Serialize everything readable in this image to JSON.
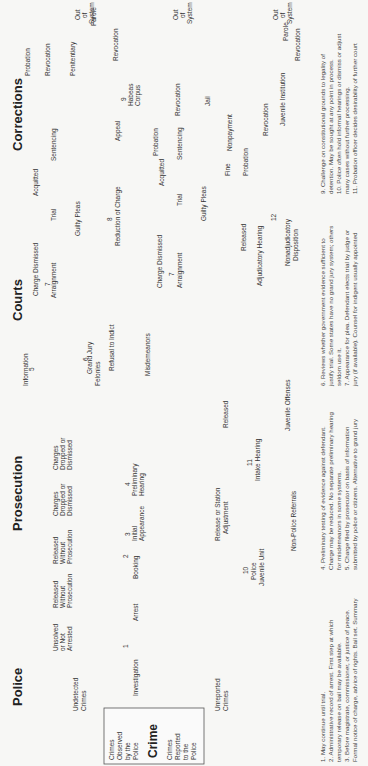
{
  "sections": {
    "police": "Police",
    "prosecution": "Prosecution",
    "courts": "Courts",
    "corrections": "Corrections"
  },
  "crime_box": {
    "observed": [
      "Crimes",
      "Observed",
      "by the",
      "Police"
    ],
    "title": "Crime",
    "reported": [
      "Crimes",
      "Reported",
      "to the",
      "Police"
    ]
  },
  "labels": {
    "undetected": [
      "Undetected",
      "Crimes"
    ],
    "unreported": [
      "Unreported",
      "Crimes"
    ],
    "unsolved": [
      "Unsolved",
      "or Not",
      "Arrested"
    ],
    "released1": [
      "Released",
      "Without",
      "Prosecution"
    ],
    "released2": [
      "Released",
      "Without",
      "Prosecution"
    ],
    "investigation": "Investigation",
    "n1": "1",
    "arrest": "Arrest",
    "booking": "Booking",
    "n2": "2",
    "initial": [
      "Initial",
      "Appearance"
    ],
    "n3": "3",
    "dropped1": [
      "Charges",
      "Dropped or",
      "Dismissed"
    ],
    "dropped2": [
      "Charges",
      "Dropped or",
      "Dismissed"
    ],
    "prelim": [
      "Preliminary",
      "Hearing"
    ],
    "n4": "4",
    "information": "Information",
    "n5": "5",
    "grand_jury": "Grand Jury",
    "n6": "6",
    "refusal": "Refusal to Indict",
    "felonies": "Felonies",
    "misdemeanors": "Misdemeanors",
    "charge_dismissed1": "Charge Dismissed",
    "charge_dismissed2": "Charge Dismissed",
    "arraignment1": "Arraignment",
    "arraignment2": "Arraignment",
    "n7a": "7",
    "n7b": "7",
    "trial1": "Trial",
    "trial2": "Trial",
    "guilty1": "Guilty Pleas",
    "guilty2": "Guilty Pleas",
    "acquitted1": "Acquitted",
    "acquitted2": "Acquitted",
    "reduction": "Reduction of Charge",
    "n8": "8",
    "sentencing1": "Sentencing",
    "sentencing2": "Sentencing",
    "appeal": "Appeal",
    "probation1": "Probation",
    "probation2": "Probation",
    "probation3": "Probation",
    "revocation1": "Revocation",
    "revocation2": "Revocation",
    "revocation3": "Revocation",
    "revocation4": "Revocation",
    "revocation5": "Revocation",
    "penitentiary": "Penitentiary",
    "parole1": "Parole",
    "parole2": "Parole",
    "habeas": [
      "9",
      "Habeas",
      "Corpus"
    ],
    "jail": "Jail",
    "fine": "Fine",
    "nonpayment": "Nonpayment",
    "out1": [
      "Out",
      "of",
      "System"
    ],
    "out2": [
      "Out",
      "of",
      "System"
    ],
    "out3": [
      "Out",
      "of",
      "System"
    ],
    "police_juvenile": [
      "10",
      "Police",
      "Juvenile Unit"
    ],
    "non_police": "Non-Police Referrals",
    "release_station": [
      "Release or Station",
      "Adjustment"
    ],
    "intake": [
      "11",
      "Intake Hearing"
    ],
    "juvenile_offenses": "Juvenile Offenses",
    "released_j1": "Released",
    "released_j2": "Released",
    "adjudicatory": "Adjudicatory Hearing",
    "n12": "12",
    "nonadjudicatory": [
      "Nonadjudicatory",
      "Disposition"
    ],
    "juvenile_institution": "Juvenile Institution"
  },
  "notes": {
    "col1": [
      "1.  May continue until trial.",
      "2.  Administrative record of arrest. First step at which",
      "temporary release on bail may be available.",
      "3.  Before magistrate, commissioner, or justice of peace.",
      "Formal notice of charge, advice of rights. Bail set. Summary"
    ],
    "col2": [
      "4.  Preliminary testing of evidence against defendant.",
      "Charge may be reduced. No separate preliminary hearing",
      "for misdemeanors in some systems.",
      "5.  Charge filed by prosecutor on basis of information",
      "submitted by police or citizens. Alternative to grand jury"
    ],
    "col3": [
      "6.  Reviews whether government evidence sufficient to",
      "justify trial. Some states have no grand jury system; others",
      "seldom use it.",
      "7.  Appearance for plea. Defendant elects trial by judge or",
      "jury (if available). Counsel for indigent usually appointed"
    ],
    "col4": [
      "9.  Challenge on constitutional grounds to legality of",
      "detention. May be sought at any point in process.",
      "10.  Police often hold informal hearings or dismiss or adjust",
      "many cases without further processing.",
      "11.  Probation officer decides desirability of further court"
    ]
  },
  "colors": {
    "flow": "#4a4a4a",
    "text": "#333333",
    "background": "#f7f7f5"
  }
}
